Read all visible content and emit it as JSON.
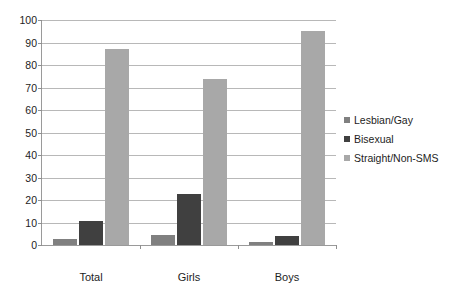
{
  "chart_data": {
    "type": "bar",
    "title": "",
    "xlabel": "",
    "ylabel": "",
    "ylim": [
      0,
      100
    ],
    "yticks": [
      0,
      10,
      20,
      30,
      40,
      50,
      60,
      70,
      80,
      90,
      100
    ],
    "grid": true,
    "legend_position": "right",
    "categories": [
      "Total",
      "Girls",
      "Boys"
    ],
    "series": [
      {
        "name": "Lesbian/Gay",
        "color": "#808080",
        "values": [
          2.5,
          4.5,
          1.5
        ]
      },
      {
        "name": "Bisexual",
        "color": "#404040",
        "values": [
          10.5,
          22.5,
          4.0
        ]
      },
      {
        "name": "Straight/Non-SMS",
        "color": "#a8a8a8",
        "values": [
          87.0,
          74.0,
          95.0
        ]
      }
    ]
  },
  "axis": {
    "y_tick_labels": [
      "100",
      "90",
      "80",
      "70",
      "60",
      "50",
      "40",
      "30",
      "20",
      "10",
      "0"
    ]
  },
  "legend": {
    "items": [
      {
        "label": "Lesbian/Gay"
      },
      {
        "label": "Bisexual"
      },
      {
        "label": "Straight/Non-SMS"
      }
    ]
  },
  "colors": {
    "series_1": "#808080",
    "series_2": "#404040",
    "series_3": "#a8a8a8",
    "gridline": "#b8b8b8",
    "axis": "#9a9a9a",
    "text": "#1d1d1d",
    "background": "#ffffff"
  }
}
